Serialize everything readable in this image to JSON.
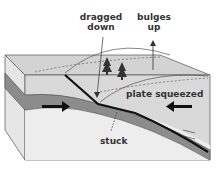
{
  "diagram": {
    "labels": {
      "dragged_down_line1": "dragged",
      "dragged_down_line2": "down",
      "bulges_up_line1": "bulges",
      "bulges_up_line2": "up",
      "plate_squeezed": "plate squeezed",
      "stuck": "stuck"
    },
    "colors": {
      "upper_plate": "#d6d6d6",
      "top_surface": "#cfcfcf",
      "subducting_plate": "#8c8c8c",
      "mantle": "#ececec",
      "fault": "#111111",
      "outline": "#555555"
    }
  }
}
